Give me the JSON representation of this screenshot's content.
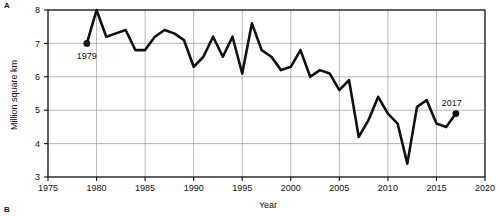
{
  "panels": {
    "a_label": "A",
    "b_label": "B"
  },
  "chart_data": {
    "type": "line",
    "title": "",
    "xlabel": "Year",
    "ylabel": "Million square km",
    "xlim": [
      1975,
      2020
    ],
    "ylim": [
      3,
      8
    ],
    "xticks": [
      1975,
      1980,
      1985,
      1990,
      1995,
      2000,
      2005,
      2010,
      2015,
      2020
    ],
    "yticks": [
      3,
      4,
      5,
      6,
      7,
      8
    ],
    "grid": true,
    "legend": "none",
    "line_color": "#111111",
    "x": [
      1979,
      1980,
      1981,
      1982,
      1983,
      1984,
      1985,
      1986,
      1987,
      1988,
      1989,
      1990,
      1991,
      1992,
      1993,
      1994,
      1995,
      1996,
      1997,
      1998,
      1999,
      2000,
      2001,
      2002,
      2003,
      2004,
      2005,
      2006,
      2007,
      2008,
      2009,
      2010,
      2011,
      2012,
      2013,
      2014,
      2015,
      2016,
      2017
    ],
    "values": [
      7.0,
      8.0,
      7.2,
      7.3,
      7.4,
      6.8,
      6.8,
      7.2,
      7.4,
      7.3,
      7.1,
      6.3,
      6.6,
      7.2,
      6.6,
      7.2,
      6.1,
      7.6,
      6.8,
      6.6,
      6.2,
      6.3,
      6.8,
      6.0,
      6.2,
      6.1,
      5.6,
      5.9,
      4.2,
      4.7,
      5.4,
      4.9,
      4.6,
      3.4,
      5.1,
      5.3,
      4.6,
      4.5,
      4.9
    ],
    "annotations": [
      {
        "label": "1979",
        "x": 1979,
        "y": 7.0,
        "marker": true
      },
      {
        "label": "2017",
        "x": 2017,
        "y": 4.9,
        "marker": true
      }
    ]
  }
}
